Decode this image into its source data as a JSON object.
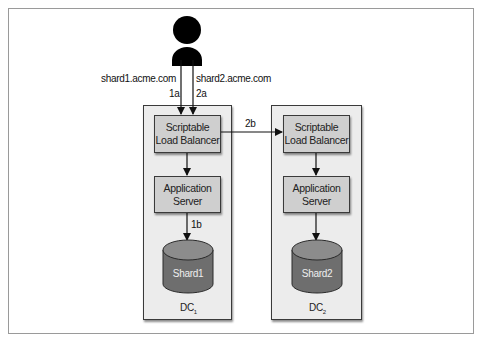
{
  "diagram": {
    "user": {
      "icon": "person-icon"
    },
    "routes": [
      {
        "domain": "shard1.acme.com",
        "step": "1a"
      },
      {
        "domain": "shard2.acme.com",
        "step": "2a"
      }
    ],
    "cross_dc_step": "2b",
    "db_step": "1b",
    "datacenters": [
      {
        "name": "DC",
        "subscript": "1",
        "load_balancer": "Scriptable\nLoad Balancer",
        "app_server": "Application\nServer",
        "shard": "Shard1"
      },
      {
        "name": "DC",
        "subscript": "2",
        "load_balancer": "Scriptable\nLoad Balancer",
        "app_server": "Application\nServer",
        "shard": "Shard2"
      }
    ],
    "colors": {
      "dc_fill": "#ececec",
      "node_fill": "#cfcfcf",
      "cylinder_top": "#8c8c8c",
      "cylinder_body": "#6e6e6e",
      "line": "#111111"
    }
  }
}
